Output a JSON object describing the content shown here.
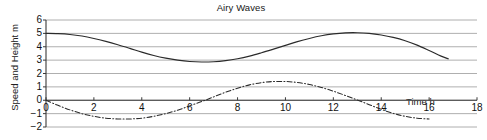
{
  "chart_data": {
    "type": "line",
    "title": "Airy Waves",
    "xlabel": "Time h",
    "ylabel": "Speed and Height m",
    "xlim": [
      0,
      18
    ],
    "ylim": [
      -2,
      6
    ],
    "grid": true,
    "legend": "none",
    "xticks": [
      "0",
      "2",
      "4",
      "6",
      "8",
      "10",
      "12",
      "14",
      "16",
      "18"
    ],
    "yticks": [
      "6",
      "5",
      "4",
      "3",
      "2",
      "1",
      "0",
      "-1",
      "-2"
    ],
    "series": [
      {
        "name": "Height",
        "style": "solid",
        "color": "#2b2b2b",
        "x": [
          0,
          0.5,
          1,
          1.5,
          2,
          2.5,
          3,
          3.5,
          4,
          4.5,
          5,
          5.5,
          6,
          6.5,
          7,
          7.5,
          8,
          8.5,
          9,
          9.5,
          10,
          10.5,
          11,
          11.5,
          12,
          12.5,
          13,
          13.5,
          14,
          14.5,
          15,
          15.5,
          16,
          16.5,
          16.8
        ],
        "y": [
          5.0,
          4.98,
          4.92,
          4.8,
          4.62,
          4.4,
          4.15,
          3.88,
          3.6,
          3.35,
          3.15,
          3.0,
          2.9,
          2.86,
          2.88,
          2.96,
          3.1,
          3.3,
          3.55,
          3.82,
          4.1,
          4.38,
          4.62,
          4.82,
          4.96,
          5.04,
          5.05,
          5.0,
          4.88,
          4.7,
          4.45,
          4.12,
          3.72,
          3.3,
          3.1
        ]
      },
      {
        "name": "Speed",
        "style": "dashdot",
        "color": "#2b2b2b",
        "x": [
          0,
          0.5,
          1,
          1.5,
          2,
          2.5,
          3,
          3.5,
          4,
          4.5,
          5,
          5.5,
          6,
          6.5,
          7,
          7.5,
          8,
          8.5,
          9,
          9.5,
          10,
          10.5,
          11,
          11.5,
          12,
          12.5,
          13,
          13.5,
          14,
          14.5,
          15,
          15.5,
          16
        ],
        "y": [
          0.0,
          -0.38,
          -0.72,
          -1.0,
          -1.2,
          -1.34,
          -1.4,
          -1.4,
          -1.34,
          -1.2,
          -1.0,
          -0.74,
          -0.42,
          -0.1,
          0.25,
          0.6,
          0.9,
          1.15,
          1.32,
          1.4,
          1.4,
          1.33,
          1.18,
          0.96,
          0.68,
          0.36,
          0.02,
          -0.33,
          -0.68,
          -0.98,
          -1.2,
          -1.34,
          -1.4
        ]
      }
    ]
  }
}
